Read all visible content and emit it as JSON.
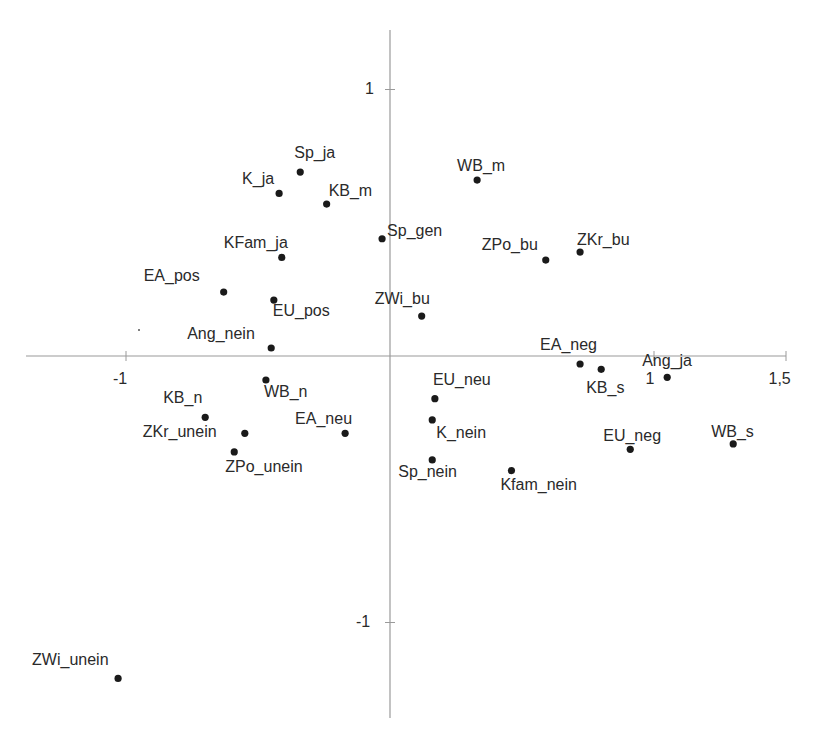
{
  "chart_data": {
    "type": "scatter",
    "title": "",
    "xlabel": "",
    "ylabel": "",
    "xlim": [
      -1.38,
      1.5
    ],
    "ylim": [
      -1.36,
      1.23
    ],
    "grid": false,
    "legend": null,
    "x_ticks": [
      {
        "value": -1,
        "label": "-1"
      },
      {
        "value": 1,
        "label": "1"
      },
      {
        "value": 1.5,
        "label": "1,5"
      }
    ],
    "y_ticks": [
      {
        "value": 1,
        "label": "1"
      },
      {
        "value": -1,
        "label": "-1"
      }
    ],
    "points": [
      {
        "label": "Sp_ja",
        "x": -0.34,
        "y": 0.69,
        "lx": -6,
        "ly": -27
      },
      {
        "label": "K_ja",
        "x": -0.42,
        "y": 0.61,
        "lx": -37,
        "ly": -22
      },
      {
        "label": "KB_m",
        "x": -0.24,
        "y": 0.57,
        "lx": 2,
        "ly": -21
      },
      {
        "label": "WB_m",
        "x": 0.33,
        "y": 0.66,
        "lx": -20,
        "ly": -22
      },
      {
        "label": "Sp_gen",
        "x": -0.03,
        "y": 0.44,
        "lx": 5,
        "ly": -16
      },
      {
        "label": "KFam_ja",
        "x": -0.41,
        "y": 0.37,
        "lx": -58,
        "ly": -22
      },
      {
        "label": "ZPo_bu",
        "x": 0.59,
        "y": 0.36,
        "lx": -64,
        "ly": -23
      },
      {
        "label": "ZKr_bu",
        "x": 0.72,
        "y": 0.39,
        "lx": -3,
        "ly": -20
      },
      {
        "label": "EA_pos",
        "x": -0.63,
        "y": 0.24,
        "lx": -80,
        "ly": -24
      },
      {
        "label": "EU_pos",
        "x": -0.44,
        "y": 0.21,
        "lx": -1,
        "ly": 3
      },
      {
        "label": "ZWi_bu",
        "x": 0.12,
        "y": 0.15,
        "lx": -47,
        "ly": -25
      },
      {
        "label": "Ang_nein",
        "x": -0.45,
        "y": 0.03,
        "lx": -84,
        "ly": -22
      },
      {
        "label": "EA_neg",
        "x": 0.72,
        "y": -0.03,
        "lx": -40,
        "ly": -27
      },
      {
        "label": "KB_s",
        "x": 0.8,
        "y": -0.05,
        "lx": -15,
        "ly": 11
      },
      {
        "label": "Ang_ja",
        "x": 1.05,
        "y": -0.08,
        "lx": -25,
        "ly": -24
      },
      {
        "label": "WB_n",
        "x": -0.47,
        "y": -0.09,
        "lx": -2,
        "ly": 4
      },
      {
        "label": "EU_neu",
        "x": 0.17,
        "y": -0.16,
        "lx": -2,
        "ly": -27
      },
      {
        "label": "KB_n",
        "x": -0.7,
        "y": -0.23,
        "lx": -42,
        "ly": -27
      },
      {
        "label": "K_nein",
        "x": 0.16,
        "y": -0.24,
        "lx": 4,
        "ly": 5
      },
      {
        "label": "ZKr_unein",
        "x": -0.55,
        "y": -0.29,
        "lx": -102,
        "ly": -9
      },
      {
        "label": "EA_neu",
        "x": -0.17,
        "y": -0.29,
        "lx": -50,
        "ly": -22
      },
      {
        "label": "WB_s",
        "x": 1.3,
        "y": -0.33,
        "lx": -22,
        "ly": -20
      },
      {
        "label": "EU_neg",
        "x": 0.91,
        "y": -0.35,
        "lx": -27,
        "ly": -21
      },
      {
        "label": "ZPo_unein",
        "x": -0.59,
        "y": -0.36,
        "lx": -9,
        "ly": 7
      },
      {
        "label": "Sp_nein",
        "x": 0.16,
        "y": -0.39,
        "lx": -34,
        "ly": 4
      },
      {
        "label": "Kfam_nein",
        "x": 0.46,
        "y": -0.43,
        "lx": -11,
        "ly": 6
      },
      {
        "label": "ZWi_unein",
        "x": -1.03,
        "y": -1.21,
        "lx": -86,
        "ly": -26
      }
    ]
  },
  "axes": {
    "origin_px": [
      390,
      356
    ],
    "x_scale_px": 264,
    "y_scale_px": 266.5,
    "x_range_px": [
      26,
      786
    ],
    "y_range_px": [
      30,
      718
    ]
  }
}
